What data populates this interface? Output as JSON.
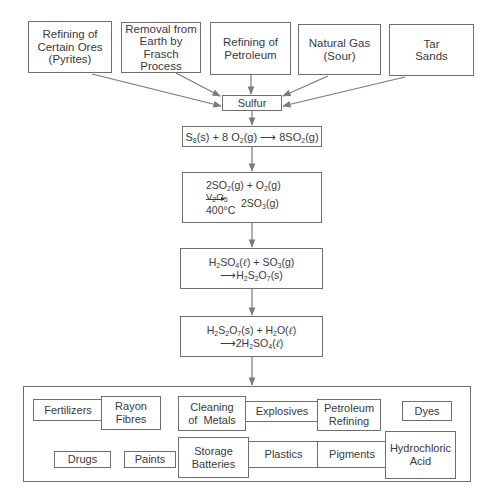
{
  "sources": [
    {
      "id": "pyrites",
      "label": "Refining of Certain Ores (Pyrites)",
      "lines": [
        "Refining of",
        "Certain Ores",
        "(Pyrites)"
      ]
    },
    {
      "id": "frasch",
      "label": "Removal from Earth by Frasch Process",
      "lines": [
        "Removal from",
        "Earth by",
        "Frasch Process"
      ]
    },
    {
      "id": "petroleum",
      "label": "Refining of Petroleum",
      "lines": [
        "Refining of",
        "Petroleum"
      ]
    },
    {
      "id": "natural-gas",
      "label": "Natural Gas (Sour)",
      "lines": [
        "Natural Gas",
        "(Sour)"
      ]
    },
    {
      "id": "tar-sands",
      "label": "Tar Sands",
      "lines": [
        "Tar",
        "Sands"
      ]
    }
  ],
  "sulfur": {
    "label": "Sulfur"
  },
  "reactions": [
    {
      "id": "combustion",
      "text": "S8(s) + 8 O2(g) → 8SO2(g)"
    },
    {
      "id": "contact",
      "text": "2SO2(g) + O2(g) → (V2O5, 400°C) 2SO3(g)",
      "catalyst": "V2O5",
      "temperature": "400°C",
      "reactants": "2SO2(g) + O2(g)",
      "product": "2SO3(g)"
    },
    {
      "id": "oleum",
      "text": "H2SO4(ℓ) + SO3(g) → H2S2O7(s)"
    },
    {
      "id": "dilution",
      "text": "H2S2O7(s) + H2O(ℓ) → 2H2SO4(ℓ)"
    }
  ],
  "applications": [
    {
      "id": "fertilizers",
      "lines": [
        "Fertilizers"
      ]
    },
    {
      "id": "rayon-fibres",
      "lines": [
        "Rayon",
        "Fibres"
      ]
    },
    {
      "id": "cleaning-metals",
      "lines": [
        "Cleaning",
        "of  Metals"
      ]
    },
    {
      "id": "explosives",
      "lines": [
        "Explosives"
      ]
    },
    {
      "id": "petroleum-refining",
      "lines": [
        "Petroleum",
        "Refining"
      ]
    },
    {
      "id": "dyes",
      "lines": [
        "Dyes"
      ]
    },
    {
      "id": "drugs",
      "lines": [
        "Drugs"
      ]
    },
    {
      "id": "paints",
      "lines": [
        "Paints"
      ]
    },
    {
      "id": "storage-batteries",
      "lines": [
        "Storage",
        "Batteries"
      ]
    },
    {
      "id": "plastics",
      "lines": [
        "Plastics"
      ]
    },
    {
      "id": "pigments",
      "lines": [
        "Pigments"
      ]
    },
    {
      "id": "hydrochloric-acid",
      "lines": [
        "Hydrochloric",
        "Acid"
      ]
    }
  ],
  "colors": {
    "line": "#6e6e6e",
    "arrow": "#7a7a7a",
    "text": "#3a3a3a"
  }
}
